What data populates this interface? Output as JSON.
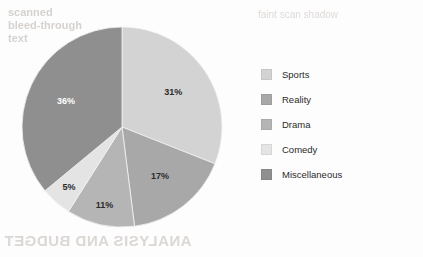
{
  "chart_data": {
    "type": "pie",
    "title": "",
    "categories": [
      "Sports",
      "Reality",
      "Drama",
      "Comedy",
      "Miscellaneous"
    ],
    "values": [
      31,
      17,
      11,
      5,
      36
    ],
    "value_labels": [
      "31%",
      "17%",
      "11%",
      "5%",
      "36%"
    ],
    "colors": [
      "#d3d3d3",
      "#a8a8a8",
      "#b5b5b5",
      "#e4e4e4",
      "#8f8f8f"
    ],
    "label_colors": [
      "#2b2b2b",
      "#2b2b2b",
      "#2b2b2b",
      "#2b2b2b",
      "#ffffff"
    ],
    "legend_position": "right",
    "start_angle_deg": 0,
    "direction": "clockwise",
    "grid": false,
    "units": "percent"
  },
  "legend": {
    "items": [
      {
        "label": "Sports",
        "color": "#d3d3d3"
      },
      {
        "label": "Reality",
        "color": "#a8a8a8"
      },
      {
        "label": "Drama",
        "color": "#b5b5b5"
      },
      {
        "label": "Comedy",
        "color": "#e4e4e4"
      },
      {
        "label": "Miscellaneous",
        "color": "#8f8f8f"
      }
    ]
  },
  "slice_labels": {
    "sports": "31%",
    "reality": "17%",
    "drama": "11%",
    "comedy": "5%",
    "miscellaneous": "36%"
  },
  "artifacts": {
    "ghost_top_left": "scanned\nbleed-through\ntext",
    "ghost_top_right": "faint scan shadow",
    "ghost_bottom": "ANALYSIS AND BUDGET"
  }
}
